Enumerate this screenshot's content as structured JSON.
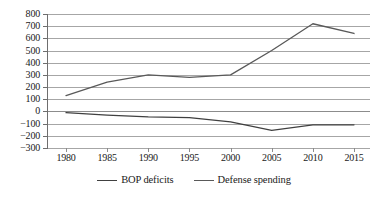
{
  "chart_data": {
    "type": "line",
    "title": "",
    "xlabel": "",
    "ylabel": "",
    "x": [
      1980,
      1985,
      1990,
      1995,
      2000,
      2005,
      2010,
      2015
    ],
    "xtick_labels": [
      "1980",
      "1985",
      "1990",
      "1995",
      "2000",
      "2005",
      "2010",
      "2015"
    ],
    "ylim": [
      -300,
      800
    ],
    "ytick_values": [
      800,
      700,
      600,
      500,
      400,
      300,
      200,
      100,
      0,
      -100,
      -200,
      -300
    ],
    "ytick_labels": [
      "800",
      "700",
      "600",
      "500",
      "400",
      "300",
      "200",
      "100",
      "0",
      "−100",
      "−200",
      "−300"
    ],
    "grid": true,
    "grid_axis": "y",
    "legend_position": "bottom-center",
    "series": [
      {
        "name": "BOP deficits",
        "color": "#404040",
        "values": [
          -10,
          -30,
          -45,
          -50,
          -85,
          -155,
          -110,
          -110
        ]
      },
      {
        "name": "Defense spending",
        "color": "#595959",
        "values": [
          130,
          240,
          300,
          280,
          300,
          500,
          720,
          640
        ]
      }
    ]
  },
  "legend": {
    "entries": [
      {
        "label": "BOP deficits"
      },
      {
        "label": "Defense spending"
      }
    ]
  }
}
